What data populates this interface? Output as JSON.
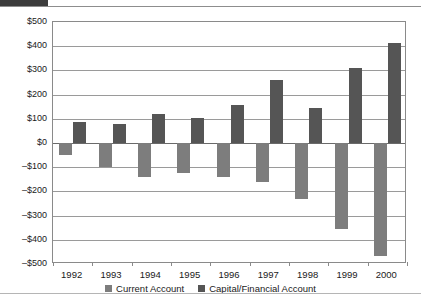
{
  "page": {
    "top_strip_text": "",
    "background_color": "#ffffff"
  },
  "legend": {
    "position": "bottom-center",
    "items": [
      {
        "label": "Current Account",
        "color": "#7d7d7d",
        "swatch_name": "legend-swatch-current"
      },
      {
        "label": "Capital/Financial Account",
        "color": "#555555",
        "swatch_name": "legend-swatch-capital"
      }
    ]
  },
  "chart_data": {
    "type": "bar",
    "title": "",
    "subtitle": "",
    "xlabel": "",
    "ylabel": "",
    "grid": true,
    "legend_position": "bottom",
    "categories": [
      "1992",
      "1993",
      "1994",
      "1995",
      "1996",
      "1997",
      "1998",
      "1999",
      "2000"
    ],
    "ylim": [
      -500,
      500
    ],
    "ytick_step": 100,
    "ytick_labels": [
      "$500",
      "$400",
      "$300",
      "$200",
      "$100",
      "$0",
      "–$100",
      "–$200",
      "–$300",
      "–$400",
      "–$500"
    ],
    "ytick_values": [
      500,
      400,
      300,
      200,
      100,
      0,
      -100,
      -200,
      -300,
      -400,
      -500
    ],
    "series": [
      {
        "name": "Current Account",
        "color": "#7d7d7d",
        "values": [
          -50,
          -100,
          -140,
          -125,
          -140,
          -160,
          -230,
          -355,
          -465
        ]
      },
      {
        "name": "Capital/Financial Account",
        "color": "#555555",
        "values": [
          85,
          78,
          118,
          105,
          155,
          260,
          145,
          310,
          415
        ]
      }
    ]
  }
}
